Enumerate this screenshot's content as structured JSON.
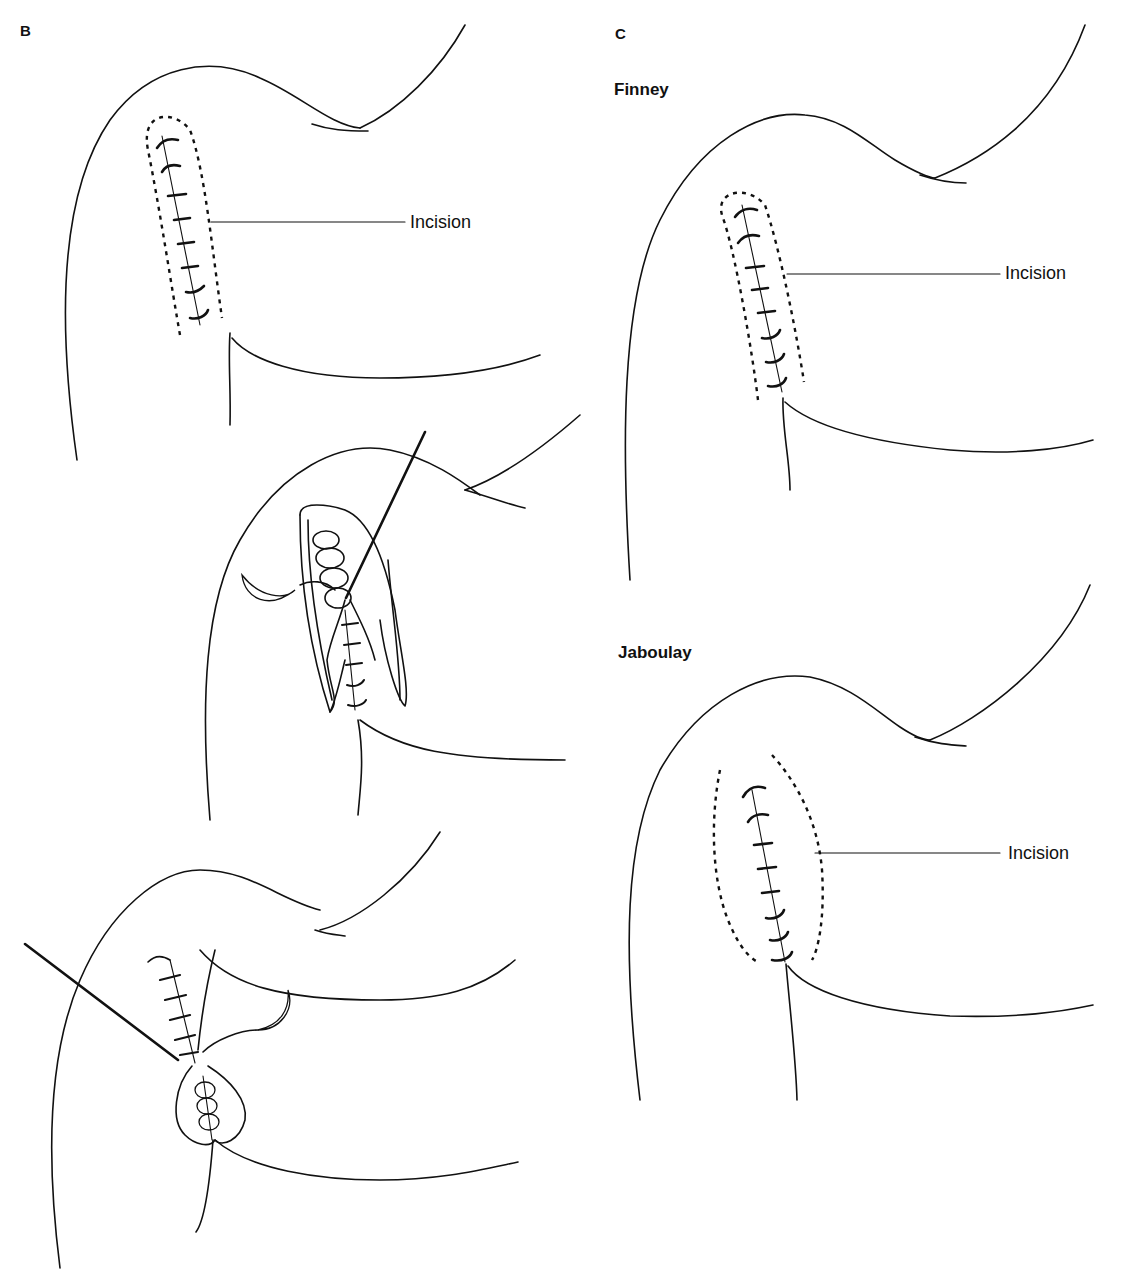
{
  "panels": {
    "B": {
      "letter": "B",
      "illustrations": [
        {
          "step": 1,
          "label": "Incision",
          "description": "Shoulder with sutured wound, dashed incision outline"
        },
        {
          "step": 2,
          "description": "Incision opened, flaps retracted, needle and suture"
        },
        {
          "step": 3,
          "description": "Closure with needle and suture, teardrop-shaped opening"
        }
      ]
    },
    "C": {
      "letter": "C",
      "sections": [
        {
          "title": "Finney",
          "label": "Incision"
        },
        {
          "title": "Jaboulay",
          "label": "Incision"
        }
      ]
    }
  },
  "colors": {
    "line": "#111111",
    "background": "#ffffff"
  }
}
